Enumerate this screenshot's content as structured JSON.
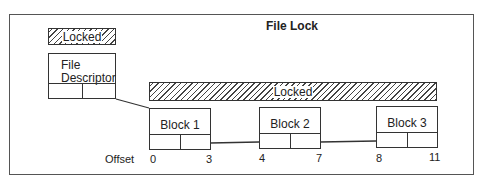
{
  "title": "File Lock",
  "legend_locked_label": "Locked",
  "file_descriptor": {
    "label_line1": "File",
    "label_line2": "Descriptor"
  },
  "locked_bar_label": "Locked",
  "blocks": [
    {
      "label": "Block 1",
      "start_offset": "0",
      "end_offset": "3"
    },
    {
      "label": "Block 2",
      "start_offset": "4",
      "end_offset": "7"
    },
    {
      "label": "Block 3",
      "start_offset": "8",
      "end_offset": "11"
    }
  ],
  "offset_label": "Offset"
}
